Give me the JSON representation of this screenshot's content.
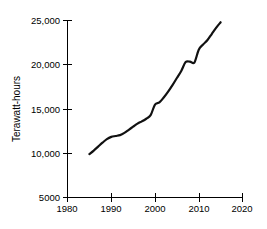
{
  "chart_data": {
    "type": "line",
    "title": "",
    "xlabel": "",
    "ylabel": "Terawatt-hours",
    "xlim": [
      1980,
      2020
    ],
    "ylim": [
      5000,
      25000
    ],
    "grid": false,
    "legend": null,
    "xticks": [
      "1980",
      "1990",
      "2000",
      "2010",
      "2020"
    ],
    "xtick_values": [
      1980,
      1990,
      2000,
      2010,
      2020
    ],
    "yticks": [
      "5000",
      "10,000",
      "15,000",
      "20,000",
      "25,000"
    ],
    "ytick_values": [
      5000,
      10000,
      15000,
      20000,
      25000
    ],
    "series": [
      {
        "name": "World electricity generation",
        "x": [
          1985,
          1986,
          1987,
          1988,
          1989,
          1990,
          1991,
          1992,
          1993,
          1994,
          1995,
          1996,
          1997,
          1998,
          1999,
          2000,
          2001,
          2002,
          2003,
          2004,
          2005,
          2006,
          2007,
          2008,
          2009,
          2010,
          2011,
          2012,
          2013,
          2014,
          2015
        ],
        "values": [
          9900,
          10300,
          10750,
          11200,
          11600,
          11850,
          11950,
          12050,
          12300,
          12650,
          13000,
          13350,
          13600,
          13900,
          14300,
          15500,
          15750,
          16300,
          16950,
          17700,
          18500,
          19300,
          20300,
          20350,
          20250,
          21700,
          22300,
          22800,
          23500,
          24200,
          24800
        ]
      }
    ]
  }
}
